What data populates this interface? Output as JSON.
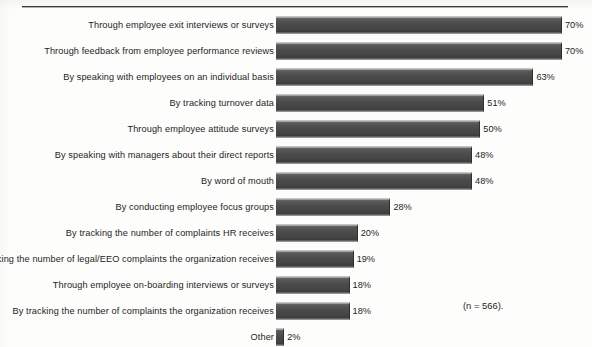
{
  "figure": {
    "sample_note": "(n = 566).",
    "bar_color": "#4b4b4b",
    "rule_color": "#3a3a3a",
    "background_color": "#fdfdfc"
  },
  "chart_data": {
    "type": "bar",
    "orientation": "horizontal",
    "title": "",
    "xlabel": "",
    "ylabel": "",
    "xlim": [
      0,
      70
    ],
    "grid": false,
    "legend": false,
    "value_suffix": "%",
    "annotations": [
      "(n = 566)."
    ],
    "categories": [
      "Through employee exit interviews or surveys",
      "Through feedback from employee performance reviews",
      "By speaking with employees on an individual basis",
      "By tracking turnover data",
      "Through employee attitude surveys",
      "By speaking with managers about their direct reports",
      "By word of mouth",
      "By conducting employee focus groups",
      "By tracking the number of complaints HR receives",
      "By tracking the number of legal/EEO complaints the organization receives",
      "Through employee on-boarding interviews or surveys",
      "By tracking the number of complaints the organization receives",
      "Other"
    ],
    "values": [
      70,
      70,
      63,
      51,
      50,
      48,
      48,
      28,
      20,
      19,
      18,
      18,
      2
    ],
    "value_labels": [
      "70%",
      "70%",
      "63%",
      "51%",
      "50%",
      "48%",
      "48%",
      "28%",
      "20%",
      "19%",
      "18%",
      "18%",
      "2%"
    ]
  }
}
